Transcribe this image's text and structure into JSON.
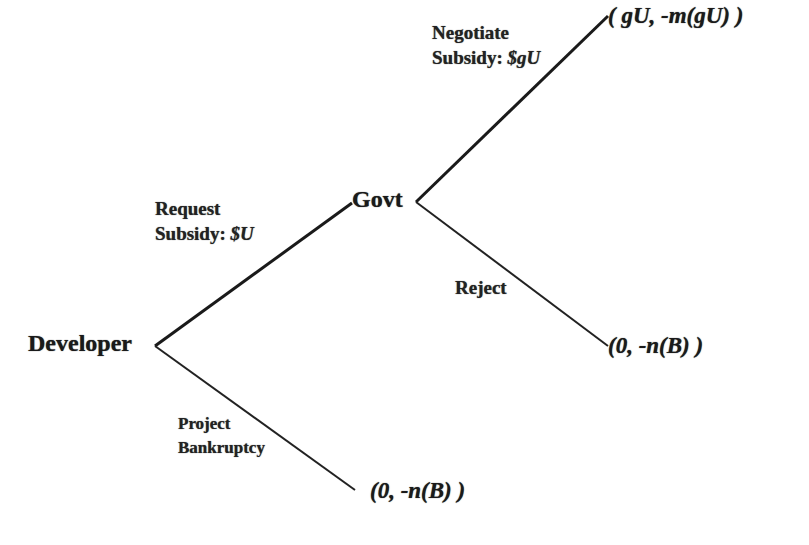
{
  "diagram": {
    "type": "game-tree",
    "nodes": {
      "developer": {
        "label": "Developer"
      },
      "govt": {
        "label": "Govt"
      }
    },
    "edges": {
      "request": {
        "line1": "Request",
        "line2_prefix": "Subsidy: ",
        "line2_value": "$U"
      },
      "bankruptcy": {
        "line1": "Project",
        "line2": "Bankruptcy"
      },
      "negotiate": {
        "line1": "Negotiate",
        "line2_prefix": "Subsidy: ",
        "line2_value": "$gU"
      },
      "reject": {
        "label": "Reject"
      }
    },
    "payoffs": {
      "negotiate": "( gU, -m(gU) )",
      "reject": "(0, -n(B) )",
      "bankruptcy": "(0, -n(B) )"
    },
    "colors": {
      "line": "#1a1a1a",
      "background": "#ffffff",
      "faint_text": "#e6e6e6"
    }
  }
}
